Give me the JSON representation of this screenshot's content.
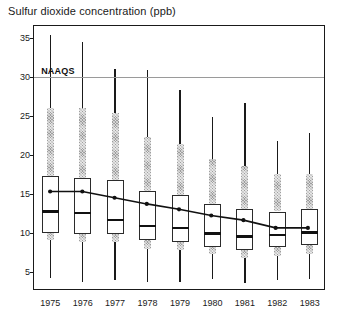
{
  "chart_data": {
    "type": "box",
    "title": "Sulfur dioxide concentration (ppb)",
    "xlabel": "",
    "ylabel": "",
    "ylim": [
      2.5,
      36.5
    ],
    "yticks": [
      5,
      10,
      15,
      20,
      25,
      30,
      35
    ],
    "ytick_labels": [
      "5",
      "10",
      "15",
      "20",
      "25",
      "30",
      "35"
    ],
    "grid": false,
    "legend": "none",
    "categories": [
      "1975",
      "1976",
      "1977",
      "1978",
      "1979",
      "1980",
      "1981",
      "1982",
      "1983"
    ],
    "annotations": [
      {
        "name": "NAAQS",
        "label": "NAAQS",
        "type": "hline",
        "value": 30,
        "color": "#9a9a9a"
      }
    ],
    "series": [
      {
        "name": "Annual mean trend",
        "type": "line",
        "marker": "dot",
        "color": "#111111",
        "values": [
          15.1,
          15.1,
          14.3,
          13.5,
          12.8,
          12.0,
          11.4,
          10.4,
          10.4
        ]
      }
    ],
    "boxes": [
      {
        "year": "1975",
        "min": 4.2,
        "band_low": 9.0,
        "q1": 10.0,
        "median": 12.7,
        "q3": 17.2,
        "band_high": 26.0,
        "max": 35.4
      },
      {
        "year": "1976",
        "min": 3.7,
        "band_low": 8.8,
        "q1": 9.8,
        "median": 12.5,
        "q3": 17.0,
        "band_high": 26.0,
        "max": 34.5
      },
      {
        "year": "1977",
        "min": 3.9,
        "band_low": 8.8,
        "q1": 9.8,
        "median": 11.6,
        "q3": 16.7,
        "band_high": 25.4,
        "max": 31.0
      },
      {
        "year": "1978",
        "min": 3.6,
        "band_low": 7.9,
        "q1": 9.0,
        "median": 10.8,
        "q3": 15.3,
        "band_high": 22.2,
        "max": 30.8
      },
      {
        "year": "1979",
        "min": 3.6,
        "band_low": 7.7,
        "q1": 8.8,
        "median": 10.6,
        "q3": 14.8,
        "band_high": 21.4,
        "max": 28.3
      },
      {
        "year": "1980",
        "min": 4.1,
        "band_low": 7.2,
        "q1": 8.2,
        "median": 9.9,
        "q3": 13.6,
        "band_high": 19.4,
        "max": 24.8
      },
      {
        "year": "1981",
        "min": 3.5,
        "band_low": 6.7,
        "q1": 7.7,
        "median": 9.5,
        "q3": 13.0,
        "band_high": 18.5,
        "max": 26.6
      },
      {
        "year": "1982",
        "min": 3.9,
        "band_low": 7.0,
        "q1": 8.2,
        "median": 9.7,
        "q3": 12.7,
        "band_high": 17.5,
        "max": 21.8
      },
      {
        "year": "1983",
        "min": 4.1,
        "band_low": 7.2,
        "q1": 8.4,
        "median": 10.0,
        "q3": 13.0,
        "band_high": 17.5,
        "max": 22.8
      }
    ]
  }
}
